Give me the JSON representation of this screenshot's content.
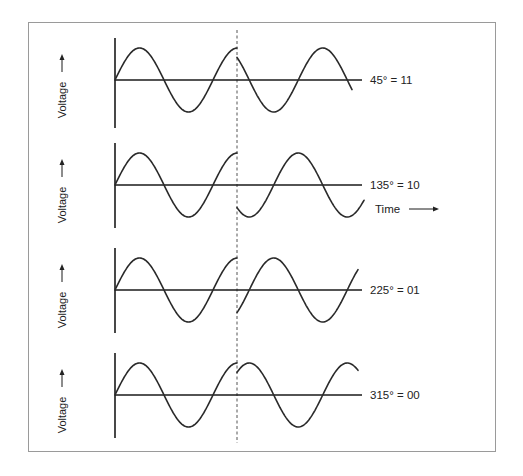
{
  "diagram": {
    "type": "phase-shift-keying-waveforms",
    "frame_color": "#9a9a9a",
    "wave_color": "#2a2a2a",
    "y_axis_label": "Voltage",
    "x_axis_label": "Time",
    "geometry": {
      "origin_x": 115,
      "break_x": 237,
      "period_px": 98,
      "amplitude_px": 32,
      "dash_top": 30,
      "dash_bottom": 443
    },
    "panels": [
      {
        "label": "45° = 11",
        "baseline_y": 80,
        "axis_top": 38,
        "axis_bottom": 128,
        "phase_after_break_deg": 135,
        "wave_end_x": 352,
        "baseline_end_x": 362,
        "show_time_label": false
      },
      {
        "label": "135° = 10",
        "baseline_y": 185,
        "axis_top": 143,
        "axis_bottom": 228,
        "phase_after_break_deg": 225,
        "wave_end_x": 364,
        "baseline_end_x": 362,
        "show_time_label": true
      },
      {
        "label": "225° = 01",
        "baseline_y": 290,
        "axis_top": 248,
        "axis_bottom": 333,
        "phase_after_break_deg": 315,
        "wave_end_x": 358,
        "baseline_end_x": 362,
        "show_time_label": false
      },
      {
        "label": "315° = 00",
        "baseline_y": 395,
        "axis_top": 353,
        "axis_bottom": 438,
        "phase_after_break_deg": 45,
        "wave_end_x": 358,
        "baseline_end_x": 362,
        "show_time_label": false
      }
    ],
    "time_label_pos": {
      "x": 375,
      "y": 213
    }
  }
}
